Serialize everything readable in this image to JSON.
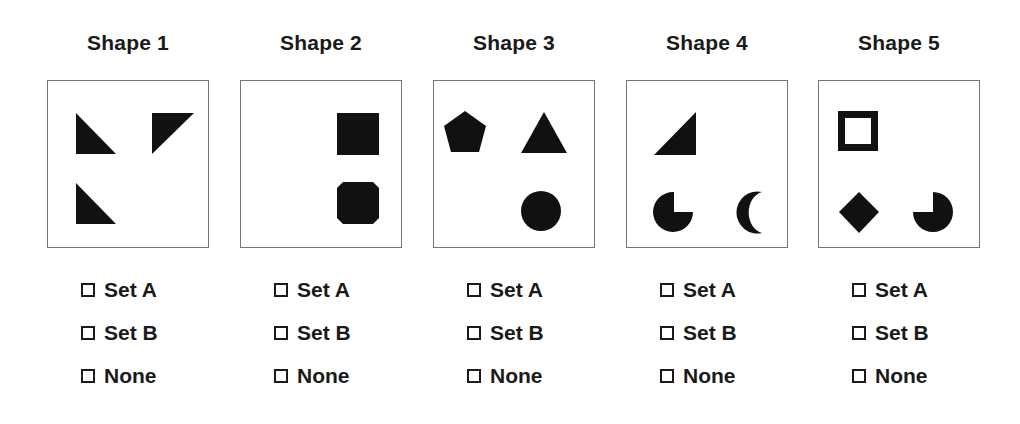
{
  "columns": [
    {
      "title": "Shape 1",
      "figure": [
        "right-triangle-bottom-left",
        "right-triangle-top-right",
        "right-triangle-bottom-left"
      ],
      "options": [
        {
          "label": "Set A",
          "checked": false
        },
        {
          "label": "Set B",
          "checked": false
        },
        {
          "label": "None",
          "checked": false
        }
      ]
    },
    {
      "title": "Shape 2",
      "figure": [
        "filled-square",
        "octagon"
      ],
      "options": [
        {
          "label": "Set A",
          "checked": false
        },
        {
          "label": "Set B",
          "checked": false
        },
        {
          "label": "None",
          "checked": false
        }
      ]
    },
    {
      "title": "Shape 3",
      "figure": [
        "pentagon",
        "triangle",
        "circle"
      ],
      "options": [
        {
          "label": "Set A",
          "checked": false
        },
        {
          "label": "Set B",
          "checked": false
        },
        {
          "label": "None",
          "checked": false
        }
      ]
    },
    {
      "title": "Shape 4",
      "figure": [
        "right-triangle-bottom-right",
        "pac-man-circle",
        "crescent"
      ],
      "options": [
        {
          "label": "Set A",
          "checked": false
        },
        {
          "label": "Set B",
          "checked": false
        },
        {
          "label": "None",
          "checked": false
        }
      ]
    },
    {
      "title": "Shape 5",
      "figure": [
        "hollow-square",
        "diamond",
        "pac-man-circle"
      ],
      "options": [
        {
          "label": "Set A",
          "checked": false
        },
        {
          "label": "Set B",
          "checked": false
        },
        {
          "label": "None",
          "checked": false
        }
      ]
    }
  ],
  "colors": {
    "shape_fill": "#111111",
    "box_border": "#777777",
    "text": "#1a1a1a"
  }
}
